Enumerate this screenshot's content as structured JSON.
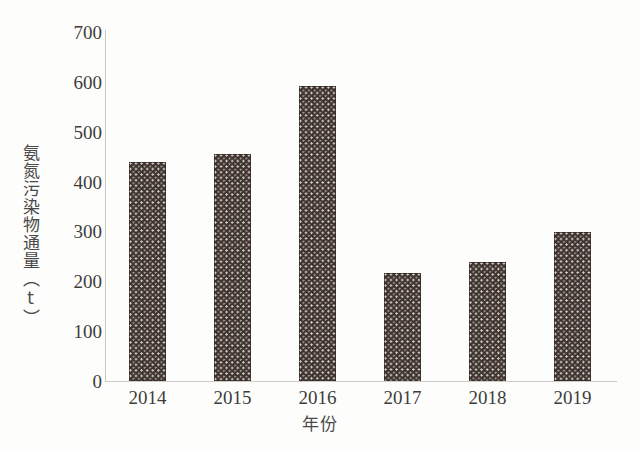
{
  "chart_data": {
    "type": "bar",
    "title": "",
    "xlabel": "年份",
    "ylabel": "氨氮污染物通量（t）",
    "categories": [
      "2014",
      "2015",
      "2016",
      "2017",
      "2018",
      "2019"
    ],
    "values": [
      440,
      455,
      592,
      217,
      239,
      299
    ],
    "series": [
      {
        "name": "氨氮污染物通量",
        "values": [
          440,
          455,
          592,
          217,
          239,
          299
        ]
      }
    ],
    "ylim": [
      0,
      700
    ],
    "yticks": [
      0,
      100,
      200,
      300,
      400,
      500,
      600,
      700
    ],
    "ytick_labels": [
      "0",
      "100",
      "200",
      "300",
      "400",
      "500",
      "600",
      "700"
    ],
    "xtick_labels": [
      "2014",
      "2015",
      "2016",
      "2017",
      "2018",
      "2019"
    ],
    "grid": false,
    "legend": false,
    "legend_position": "none",
    "bar_fill": "#3b302c",
    "bar_pattern": "dense-dotted-texture",
    "axis_color": "#cfccc8",
    "background": "#fdfdfc"
  }
}
